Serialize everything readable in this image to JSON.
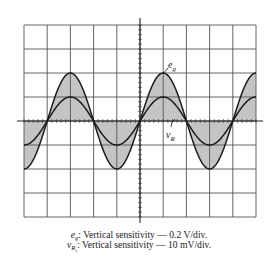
{
  "figure": {
    "type": "oscilloscope-display",
    "colors": {
      "background": "#ffffff",
      "grid": "#555555",
      "trace": "#1a1a1a",
      "fill": "#c4c4c4"
    }
  },
  "chart_data": {
    "type": "line",
    "title": "",
    "xlabel": "",
    "ylabel": "",
    "grid": true,
    "grid_divisions": {
      "horizontal": 10,
      "vertical": 8
    },
    "minor_ticks_per_division": 5,
    "xlim": [
      -5,
      5
    ],
    "ylim": [
      -4,
      4
    ],
    "units": "divisions",
    "series": [
      {
        "name": "e_g",
        "label": "e",
        "label_sub": "g",
        "function": "sine",
        "amplitude_div": 2,
        "period_div": 4,
        "phase_zero_crossing_rising_div": -4,
        "filled": true,
        "vertical_sensitivity": "0.2 V/div.",
        "peak_value": "0.4 V",
        "x": [
          -5,
          -4,
          -3,
          -2,
          -1,
          0,
          1,
          2,
          3,
          4,
          5
        ],
        "values": [
          -2,
          0,
          2,
          0,
          -2,
          0,
          2,
          0,
          -2,
          0,
          2
        ]
      },
      {
        "name": "v_R",
        "label": "v",
        "label_sub": "R",
        "function": "sine",
        "amplitude_div": 1,
        "period_div": 4,
        "phase_zero_crossing_rising_div": -4,
        "filled": false,
        "vertical_sensitivity": "10 mV/div.",
        "peak_value": "10 mV",
        "x": [
          -5,
          -4,
          -3,
          -2,
          -1,
          0,
          1,
          2,
          3,
          4,
          5
        ],
        "values": [
          -1,
          0,
          1,
          0,
          -1,
          0,
          1,
          0,
          -1,
          0,
          1
        ]
      }
    ],
    "annotations": [
      {
        "text": "e_g",
        "points_to": "e_g trace near positive peak at x=1"
      },
      {
        "text": "v_R",
        "points_to": "v_R trace near zero crossing at x=2"
      }
    ]
  },
  "caption": {
    "line1": {
      "symbol": "e",
      "sub": "g",
      "text": ": Vertical sensitivity  —  0.2 V/div."
    },
    "line2": {
      "symbol": "v",
      "sub": "R",
      "subsub": "s",
      "text": ": Vertical sensitivity  —  10 mV/div."
    }
  }
}
